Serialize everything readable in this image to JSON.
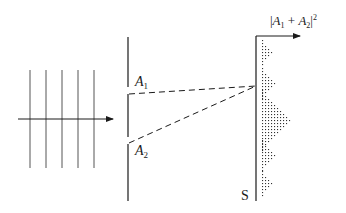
{
  "diagram": {
    "incident_wave": {
      "wavefront_count": 5,
      "wavefront_x": [
        30,
        46,
        62,
        78,
        94
      ],
      "wavefront_y_range": [
        70,
        168
      ],
      "propagation_arrow": {
        "x1": 18,
        "x2": 113,
        "y": 119
      }
    },
    "barrier": {
      "x": 128,
      "slits": [
        {
          "label_main": "A",
          "label_sub": "1",
          "y": 90
        },
        {
          "label_main": "A",
          "label_sub": "2",
          "y": 140
        }
      ]
    },
    "screen": {
      "label": "S",
      "x": 256,
      "y_top": 36,
      "y_bottom": 200,
      "convergence_point_y": 86
    },
    "intensity_axis": {
      "label_parts": [
        "|",
        "A",
        "1",
        " + ",
        "A",
        "2",
        "|",
        "2"
      ]
    },
    "intensity_pattern": {
      "fringes": [
        {
          "center_y": 52,
          "peak": 3
        },
        {
          "center_y": 83,
          "peak": 4
        },
        {
          "center_y": 120,
          "peak": 9
        },
        {
          "center_y": 155,
          "peak": 4
        },
        {
          "center_y": 183,
          "peak": 3
        }
      ],
      "colors": {
        "dots": "#333333",
        "lines": "#1a1a1a"
      }
    }
  }
}
